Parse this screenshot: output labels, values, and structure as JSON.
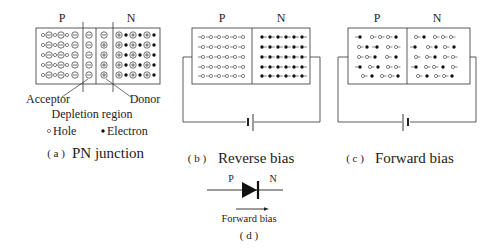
{
  "panel_a": {
    "p_label": "P",
    "n_label": "N",
    "acceptor_label": "Acceptor",
    "donor_label": "Donor",
    "depletion_label": "Depletion region",
    "legend_hole": "Hole",
    "legend_electron": "Electron",
    "caption_prefix": "( a )",
    "caption": "PN junction"
  },
  "panel_b": {
    "p_label": "P",
    "n_label": "N",
    "caption_prefix": "( b )",
    "caption": "Reverse bias"
  },
  "panel_c": {
    "p_label": "P",
    "n_label": "N",
    "caption_prefix": "( c )",
    "caption": "Forward bias"
  },
  "panel_d": {
    "p_label": "P",
    "n_label": "N",
    "arrow_label": "Forward bias",
    "caption": "( d )"
  },
  "colors": {
    "line": "#333333",
    "text": "#222222",
    "background": "#ffffff"
  }
}
